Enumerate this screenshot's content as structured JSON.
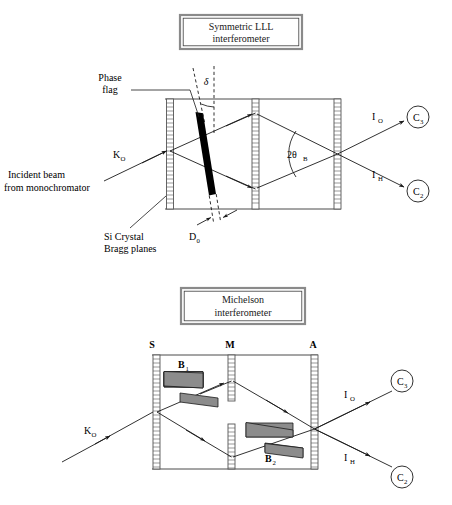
{
  "figure": {
    "background": "#ffffff",
    "width": 452,
    "height": 505,
    "ink_color": "#1a1a1a",
    "wedge_fill": "#8c8c8c",
    "flag_fill": "#000000",
    "blade_stroke": "#555555"
  },
  "panel_lll": {
    "title_box": {
      "line1": "Symmetric LLL",
      "line2": "interferometer"
    },
    "labels": {
      "phase_flag_line1": "Phase",
      "phase_flag_line2": "flag",
      "delta": "δ",
      "incident_wave_vector": "K",
      "incident_wave_vector_sub": "O",
      "incident_beam_line1": "Incident beam",
      "incident_beam_line2": "from monochromator",
      "si_crystal_line1": "Si Crystal",
      "si_crystal_line2": "Bragg planes",
      "flag_thickness": "D",
      "flag_thickness_sub": "0",
      "bragg_angle": "2θ",
      "bragg_angle_sub": "B",
      "beam_io": "I",
      "beam_io_sub": "O",
      "beam_ih": "I",
      "beam_ih_sub": "H",
      "detector3": "C",
      "detector3_sub": "3",
      "detector2": "C",
      "detector2_sub": "2"
    }
  },
  "panel_michelson": {
    "title_box": {
      "line1": "Michelson",
      "line2": "interferometer"
    },
    "labels": {
      "blade_s": "S",
      "blade_m": "M",
      "blade_a": "A",
      "wedge_b1": "B",
      "wedge_b1_sub": "1",
      "wedge_b2": "B",
      "wedge_b2_sub": "2",
      "incident_wave_vector": "K",
      "incident_wave_vector_sub": "O",
      "beam_io": "I",
      "beam_io_sub": "O",
      "beam_ih": "I",
      "beam_ih_sub": "H",
      "detector3": "C",
      "detector3_sub": "3",
      "detector2": "C",
      "detector2_sub": "2"
    }
  }
}
